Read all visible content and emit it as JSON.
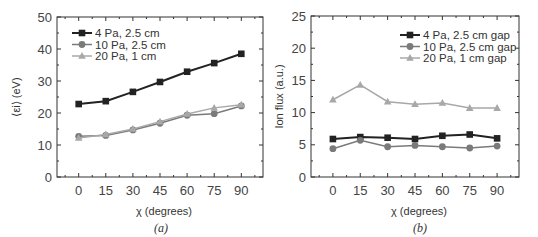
{
  "chart_data": [
    {
      "type": "line",
      "panel": "(a)",
      "xlabel": "χ (degrees)",
      "ylabel": "⟨εi⟩ (eV)",
      "x": [
        0,
        15,
        30,
        45,
        60,
        75,
        90
      ],
      "xlim": [
        -12,
        102
      ],
      "ylim": [
        0,
        50
      ],
      "yticks": [
        0,
        10,
        20,
        30,
        40,
        50
      ],
      "grid": false,
      "legend_position": "upper left",
      "series": [
        {
          "name": "4 Pa, 2.5 cm",
          "marker": "square",
          "color": "#222222",
          "values": [
            22.8,
            23.7,
            26.6,
            29.7,
            32.9,
            35.6,
            38.5
          ]
        },
        {
          "name": "10 Pa, 2.5 cm",
          "marker": "circle",
          "color": "#7a7a7a",
          "values": [
            12.7,
            13.0,
            14.7,
            16.8,
            19.3,
            19.8,
            22.2
          ]
        },
        {
          "name": "20 Pa, 1 cm",
          "marker": "triangle",
          "color": "#a8a8a8",
          "values": [
            12.2,
            13.3,
            15.0,
            17.3,
            19.7,
            21.6,
            22.6
          ]
        }
      ]
    },
    {
      "type": "line",
      "panel": "(b)",
      "xlabel": "χ (degrees)",
      "ylabel": "Ion flux (a.u.)",
      "x": [
        0,
        15,
        30,
        45,
        60,
        75,
        90
      ],
      "xlim": [
        -12,
        102
      ],
      "ylim": [
        0,
        25
      ],
      "yticks": [
        0,
        5,
        10,
        15,
        20,
        25
      ],
      "grid": false,
      "legend_position": "upper right",
      "series": [
        {
          "name": "4 Pa, 2.5 cm gap",
          "marker": "square",
          "color": "#222222",
          "values": [
            5.9,
            6.2,
            6.1,
            5.9,
            6.4,
            6.6,
            6.0
          ]
        },
        {
          "name": "10 Pa, 2.5 cm gap",
          "marker": "circle",
          "color": "#7a7a7a",
          "values": [
            4.4,
            5.7,
            4.7,
            4.9,
            4.7,
            4.5,
            4.8
          ]
        },
        {
          "name": "20 Pa, 1 cm gap",
          "marker": "triangle",
          "color": "#a8a8a8",
          "values": [
            12.0,
            14.3,
            11.7,
            11.3,
            11.5,
            10.7,
            10.7
          ]
        }
      ]
    }
  ]
}
